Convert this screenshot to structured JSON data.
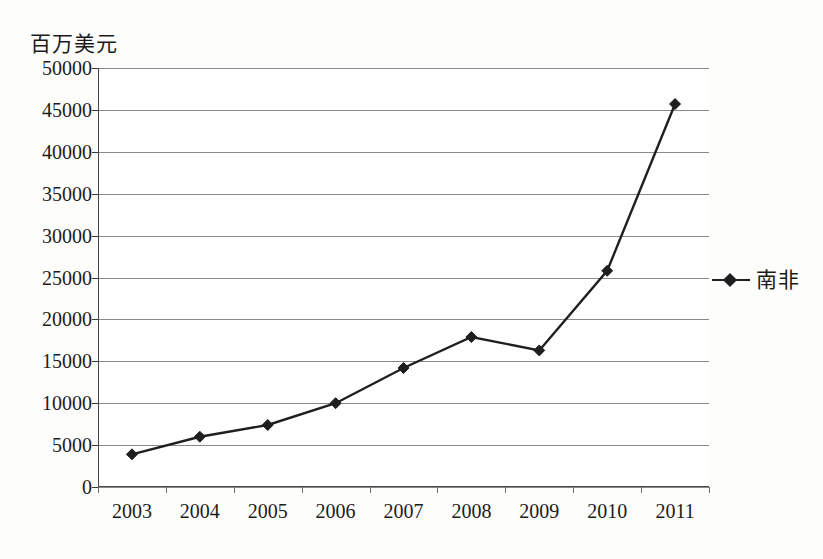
{
  "chart_data": {
    "type": "line",
    "title": "",
    "xlabel": "",
    "ylabel": "百万美元",
    "ylim": [
      0,
      50000
    ],
    "ytick_step": 5000,
    "grid": true,
    "legend_position": "right",
    "categories": [
      "2003",
      "2004",
      "2005",
      "2006",
      "2007",
      "2008",
      "2009",
      "2010",
      "2011"
    ],
    "ytick_labels": [
      "0",
      "5000",
      "10000",
      "15000",
      "20000",
      "25000",
      "30000",
      "35000",
      "40000",
      "45000",
      "50000"
    ],
    "yticks": [
      0,
      5000,
      10000,
      15000,
      20000,
      25000,
      30000,
      35000,
      40000,
      45000,
      50000
    ],
    "series": [
      {
        "name": "南非",
        "marker": "diamond",
        "color": "#1f1f1f",
        "values": [
          3900,
          6000,
          7400,
          10000,
          14200,
          17900,
          16300,
          25800,
          45700
        ]
      }
    ]
  },
  "legend": {
    "entries": [
      {
        "label": "南非",
        "marker_name": "diamond-marker"
      }
    ]
  },
  "axis": {
    "y_unit_caption": "百万美元"
  }
}
